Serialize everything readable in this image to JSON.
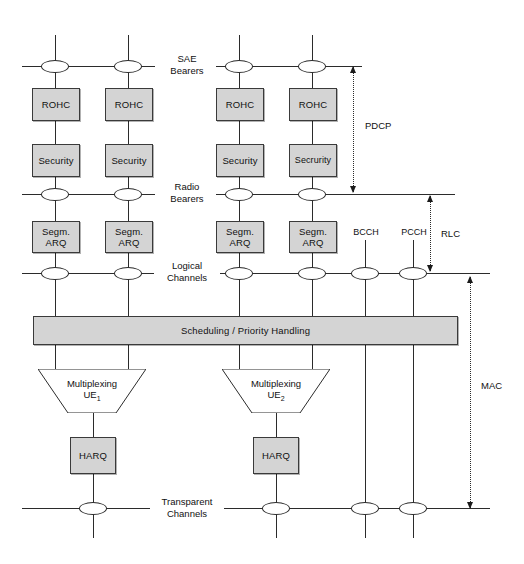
{
  "diagram": {
    "colors": {
      "box_fill": "#d4d4d4",
      "line": "#2b2b2b",
      "background": "#ffffff"
    },
    "stage_labels": [
      {
        "id": "sae-bearers",
        "text": "SAE\nBearers",
        "y": 54
      },
      {
        "id": "radio-bearers",
        "text": "Radio\nBearers",
        "y": 183
      },
      {
        "id": "logical-channels",
        "text": "Logical\nChannels",
        "y": 262
      },
      {
        "id": "transparent-channels",
        "text": "Transparent\nChannels",
        "y": 510
      }
    ],
    "boxes": [
      {
        "id": "rohc-1",
        "label": "ROHC",
        "x": 32,
        "y": 88,
        "w": 48,
        "h": 33
      },
      {
        "id": "rohc-2",
        "label": "ROHC",
        "x": 105,
        "y": 88,
        "w": 48,
        "h": 33
      },
      {
        "id": "rohc-3",
        "label": "ROHC",
        "x": 216,
        "y": 88,
        "w": 48,
        "h": 33
      },
      {
        "id": "rohc-4",
        "label": "ROHC",
        "x": 289,
        "y": 88,
        "w": 48,
        "h": 33
      },
      {
        "id": "security-1",
        "label": "Security",
        "x": 32,
        "y": 144,
        "w": 48,
        "h": 33
      },
      {
        "id": "security-2",
        "label": "Security",
        "x": 105,
        "y": 144,
        "w": 48,
        "h": 33
      },
      {
        "id": "security-3",
        "label": "Security",
        "x": 216,
        "y": 144,
        "w": 48,
        "h": 33
      },
      {
        "id": "security-4",
        "label": "Secrurity",
        "x": 289,
        "y": 144,
        "w": 48,
        "h": 33
      },
      {
        "id": "segm-arq-1",
        "label": "Segm.\nARQ",
        "x": 32,
        "y": 221,
        "w": 48,
        "h": 32
      },
      {
        "id": "segm-arq-2",
        "label": "Segm.\nARQ",
        "x": 105,
        "y": 221,
        "w": 48,
        "h": 32
      },
      {
        "id": "segm-arq-3",
        "label": "Segm.\nARQ",
        "x": 216,
        "y": 221,
        "w": 48,
        "h": 32
      },
      {
        "id": "segm-arq-4",
        "label": "Segm.\nARQ",
        "x": 289,
        "y": 221,
        "w": 48,
        "h": 32
      },
      {
        "id": "harq-1",
        "label": "HARQ",
        "x": 72,
        "y": 437,
        "w": 46,
        "h": 37
      },
      {
        "id": "harq-2",
        "label": "HARQ",
        "x": 255,
        "y": 437,
        "w": 46,
        "h": 37
      }
    ],
    "scheduling_bar": {
      "id": "scheduling-priority-handling",
      "label": "Scheduling / Priority Handling",
      "x": 33,
      "y": 316,
      "w": 425,
      "h": 29
    },
    "multiplexers": [
      {
        "id": "multiplexing-ue1",
        "label": "Multiplexing",
        "sub_label": "UE",
        "sub_index": "1",
        "x": 38,
        "y": 369,
        "w": 108,
        "h": 44
      },
      {
        "id": "multiplexing-ue2",
        "label": "Multiplexing",
        "sub_label": "UE",
        "sub_index": "2",
        "x": 222,
        "y": 369,
        "w": 108,
        "h": 44
      }
    ],
    "channel_labels": [
      {
        "id": "bcch",
        "label": "BCCH",
        "x": 365,
        "y": 232
      },
      {
        "id": "pcch",
        "label": "PCCH",
        "x": 413,
        "y": 232
      }
    ],
    "layer_brackets": [
      {
        "id": "pdcp-bracket",
        "label": "PDCP",
        "x": 353,
        "y_top": 67,
        "y_bottom": 192,
        "label_x": 365,
        "label_y": 126
      },
      {
        "id": "rlc-bracket",
        "label": "RLC",
        "x": 430,
        "y_top": 196,
        "y_bottom": 271,
        "label_x": 441,
        "label_y": 228
      },
      {
        "id": "mac-bracket",
        "label": "MAC",
        "x": 470,
        "y_top": 277,
        "y_bottom": 508,
        "label_x": 481,
        "label_y": 386
      }
    ],
    "bus_lines": [
      {
        "id": "sae-bearers-bus-left",
        "x1": 22,
        "x2": 155,
        "y": 66
      },
      {
        "id": "sae-bearers-bus-right",
        "x1": 213,
        "x2": 362,
        "y": 66
      },
      {
        "id": "radio-bearers-bus-left",
        "x1": 22,
        "x2": 155,
        "y": 194
      },
      {
        "id": "radio-bearers-bus-right",
        "x1": 213,
        "x2": 455,
        "y": 194
      },
      {
        "id": "logical-channels-bus-left",
        "x1": 22,
        "x2": 155,
        "y": 273
      },
      {
        "id": "logical-channels-bus-right",
        "x1": 213,
        "x2": 490,
        "y": 273
      },
      {
        "id": "transparent-channels-bus-left",
        "x1": 22,
        "x2": 155,
        "y": 508
      },
      {
        "id": "transparent-channels-bus-right",
        "x1": 213,
        "x2": 490,
        "y": 508
      }
    ],
    "nodes": [
      {
        "id": "node-sae-1",
        "cx": 55,
        "cy": 66
      },
      {
        "id": "node-sae-2",
        "cx": 128,
        "cy": 66
      },
      {
        "id": "node-sae-3",
        "cx": 239,
        "cy": 66
      },
      {
        "id": "node-sae-4",
        "cx": 312,
        "cy": 66
      },
      {
        "id": "node-radio-1",
        "cx": 55,
        "cy": 194
      },
      {
        "id": "node-radio-2",
        "cx": 128,
        "cy": 194
      },
      {
        "id": "node-radio-3",
        "cx": 239,
        "cy": 194
      },
      {
        "id": "node-radio-4",
        "cx": 312,
        "cy": 194
      },
      {
        "id": "node-logical-1",
        "cx": 55,
        "cy": 273
      },
      {
        "id": "node-logical-2",
        "cx": 128,
        "cy": 273
      },
      {
        "id": "node-logical-3",
        "cx": 239,
        "cy": 273
      },
      {
        "id": "node-logical-4",
        "cx": 312,
        "cy": 273
      },
      {
        "id": "node-logical-bcch",
        "cx": 365,
        "cy": 273
      },
      {
        "id": "node-logical-pcch",
        "cx": 413,
        "cy": 273
      },
      {
        "id": "node-transparent-1",
        "cx": 93,
        "cy": 508
      },
      {
        "id": "node-transparent-2",
        "cx": 276,
        "cy": 508
      },
      {
        "id": "node-transparent-bcch",
        "cx": 365,
        "cy": 508
      },
      {
        "id": "node-transparent-pcch",
        "cx": 413,
        "cy": 508
      }
    ]
  }
}
